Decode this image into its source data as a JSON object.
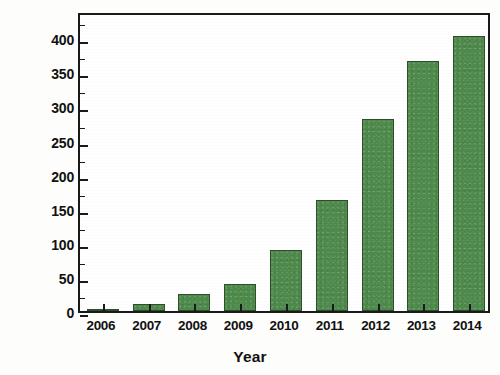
{
  "chart_data": {
    "type": "bar",
    "title": "",
    "xlabel": "Year",
    "ylabel": "Number of citations",
    "categories": [
      "2006",
      "2007",
      "2008",
      "2009",
      "2010",
      "2011",
      "2012",
      "2013",
      "2014"
    ],
    "values": [
      3,
      11,
      25,
      39,
      89,
      163,
      282,
      367,
      404
    ],
    "ylim": [
      0,
      440
    ],
    "xlim_categories": 9,
    "y_major_ticks": [
      0,
      50,
      100,
      150,
      200,
      250,
      300,
      350,
      400
    ],
    "y_tick_labels": [
      "0",
      "50",
      "100",
      "150",
      "200",
      "250",
      "300",
      "350",
      "400"
    ],
    "y_minor_ticks": [
      25,
      75,
      125,
      175,
      225,
      275,
      325,
      375,
      425
    ],
    "grid": false,
    "legend": null,
    "legend_position": "none",
    "series": [
      {
        "name": "Number of citations",
        "values": [
          3,
          11,
          25,
          39,
          89,
          163,
          282,
          367,
          404
        ]
      }
    ],
    "colors": {
      "bar_fill": "#4e8a4b",
      "bar_edge": "#2f4f2c",
      "axis": "#1a1a1a",
      "text": "#111111",
      "background": "#ffffff"
    }
  }
}
